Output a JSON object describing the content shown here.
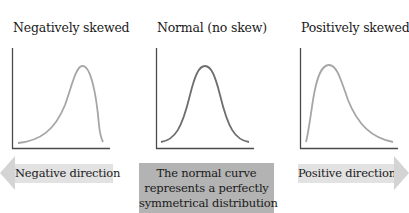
{
  "panels": [
    {
      "title": "Negatively skewed",
      "curve_color": "#a6a6a6"
    },
    {
      "title": "Normal (no skew)",
      "curve_color": "#6e6e6e"
    },
    {
      "title": "Positively skewed",
      "curve_color": "#a6a6a6"
    }
  ],
  "negative_arrow": {
    "label": "Negative direction",
    "color": "#e2e2e2"
  },
  "positive_arrow": {
    "label": "Positive direction",
    "color": "#e2e2e2"
  },
  "normal_note": {
    "lines": [
      "The normal curve",
      "represents a perfectly",
      "symmetrical distribution"
    ],
    "color": "#b3b3b3"
  },
  "axis_color": "#4a4a4a"
}
